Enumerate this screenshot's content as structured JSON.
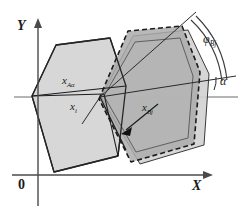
{
  "figure": {
    "type": "geometry-diagram",
    "background_color": "#ffffff",
    "line_color": "#1b1b1b",
    "axis_color": "#4a4a4a"
  },
  "axes": {
    "y_label": "Y",
    "x_label": "X",
    "origin_label": "0",
    "origin_px": {
      "x": 38,
      "y": 175
    },
    "x_axis": {
      "x1": 12,
      "y1": 175,
      "x2": 212,
      "y2": 175
    },
    "y_axis": {
      "x1": 38,
      "y1": 205,
      "x2": 38,
      "y2": 18
    },
    "horizontal_ref": {
      "x1": 14,
      "y1": 97,
      "x2": 238,
      "y2": 97
    }
  },
  "labels": {
    "x_A_alpha": {
      "base": "x",
      "sub": "Aα",
      "x": 62,
      "y": 82
    },
    "x_i": {
      "base": "x",
      "sub": "i",
      "x": 70,
      "y": 107
    },
    "x_Bj": {
      "base": "x",
      "sub": "Bj",
      "x": 144,
      "y": 108
    },
    "phi_Bj": {
      "base": "φ",
      "sub": "Bj",
      "x": 205,
      "y": 40
    },
    "alpha": {
      "base": "α",
      "sub": "",
      "x": 219,
      "y": 82
    }
  },
  "shapes": {
    "left_polygon": {
      "name": "left-hexagon",
      "fill": "#d7d7d7",
      "stroke": "#262626",
      "stroke_width": 1.3,
      "dashed": false,
      "points": "32,96 56,45 110,38 126,86 118,156 54,172"
    },
    "right_light_polygon": {
      "name": "right-light-hexagon",
      "fill": "#d2d2d2",
      "stroke": "#3a3a3a",
      "stroke_width": 1.0,
      "dashed": false,
      "points": "101,97 133,36 188,30 209,74 204,145 140,164"
    },
    "right_dark_polygon": {
      "name": "right-dark-hexagon-dashed",
      "fill": "#ababab",
      "stroke": "#1b1b1b",
      "stroke_width": 1.6,
      "dashed": true,
      "points": "99,99 128,31 182,26 200,72 194,144 131,162"
    },
    "right_inner_polygon": {
      "name": "right-inner-hexagon",
      "fill": "#b5b5b5",
      "stroke": "#555555",
      "stroke_width": 0.9,
      "dashed": false,
      "points": "104,96 135,42 180,38 193,76 188,138 136,152"
    }
  },
  "lines": {
    "x_A_alpha_ray": {
      "name": "x-A-alpha-ray",
      "x1": 32,
      "y1": 96,
      "x2": 104,
      "y2": 94
    },
    "x_i_ray": {
      "name": "x-i-ray",
      "x1": 100,
      "y1": 97,
      "x2": 84,
      "y2": 122
    },
    "x_Bj_arrow": {
      "name": "x-Bj-arrow",
      "x1": 158,
      "y1": 104,
      "x2": 124,
      "y2": 132
    },
    "alpha_ray": {
      "name": "alpha-ray",
      "x1": 100,
      "y1": 97,
      "x2": 236,
      "y2": 76
    },
    "phi_ray": {
      "name": "phi-ray",
      "x1": 100,
      "y1": 97,
      "x2": 196,
      "y2": 12
    },
    "chord_left": {
      "name": "chord-left-upper",
      "x1": 32,
      "y1": 96,
      "x2": 126,
      "y2": 86
    },
    "chord_lower": {
      "name": "chord-lower",
      "x1": 100,
      "y1": 97,
      "x2": 126,
      "y2": 150
    }
  },
  "arc": {
    "name": "phi-Bj-arc",
    "note": "double-stroke arc from phi ray to alpha ray",
    "outer": "M 196,16 A 104,104 0 0 1 226,79",
    "inner": "M 192,19 A 99,99 0 0 1 221,80",
    "alpha_arc": "M 216,89 A 22,22 0 0 0 219,76"
  }
}
